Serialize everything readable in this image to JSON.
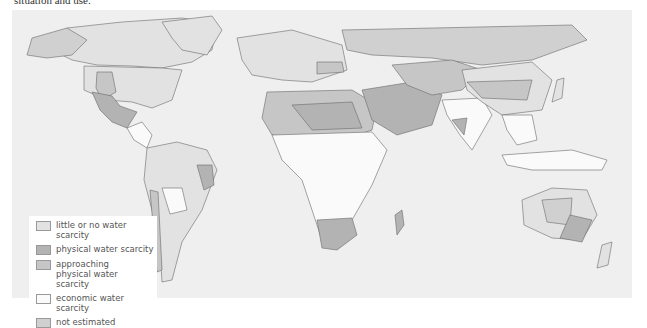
{
  "caption_fragment": "situation and use.",
  "map": {
    "title": "World water scarcity",
    "colors": {
      "ocean": "#efefef",
      "little_or_no": "#e2e2e2",
      "physical": "#b3b3b3",
      "approaching_physical": "#c6c6c6",
      "economic": "#fafafa",
      "not_estimated": "#d0d0d0",
      "border": "#6a6a6a"
    }
  },
  "legend": {
    "items": [
      {
        "label": "little or no water scarcity",
        "color": "#e2e2e2"
      },
      {
        "label": "physical water scarcity",
        "color": "#b3b3b3"
      },
      {
        "label": "approaching physical water scarcity",
        "color": "#c6c6c6"
      },
      {
        "label": "economic water scarcity",
        "color": "#fafafa"
      },
      {
        "label": "not estimated",
        "color": "#d0d0d0"
      }
    ]
  }
}
